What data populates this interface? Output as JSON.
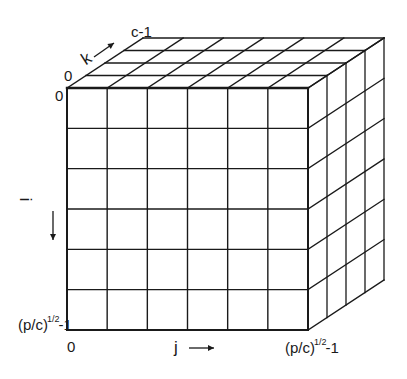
{
  "diagram": {
    "colors": {
      "stroke": "#1a1a1a",
      "background": "#ffffff"
    },
    "grid": {
      "rows": 6,
      "cols": 6,
      "depth_layers": 4
    },
    "front_face": {
      "x0": 67,
      "y0": 88,
      "x1": 308,
      "y1": 330
    },
    "depth_offset": {
      "dx": 76,
      "dy": -50
    },
    "labels": {
      "k_axis": "k",
      "k_start": "0",
      "k_end": "c-1",
      "i_axis": "i",
      "i_start": "0",
      "i_end_base": "(p/c)",
      "i_end_exp": "1/2",
      "i_end_suffix": "-1",
      "j_axis": "j",
      "j_start": "0",
      "j_end_base": "(p/c)",
      "j_end_exp": "1/2",
      "j_end_suffix": "-1"
    },
    "icons": {
      "k_arrow": "diagonal-double-arrow-icon",
      "i_arrow": "down-arrow-icon",
      "j_arrow": "right-arrow-icon"
    }
  }
}
